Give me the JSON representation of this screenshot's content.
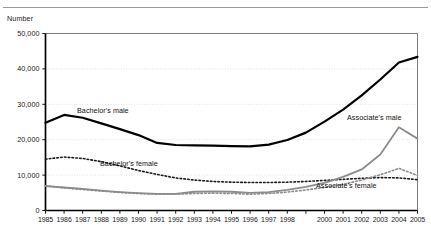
{
  "axis_label_y": "Number",
  "y_ticks": [
    "0",
    "10,000",
    "20,000",
    "30,000",
    "40,000",
    "50,000"
  ],
  "x_ticks": [
    "1985",
    "1986",
    "1987",
    "1988",
    "1989",
    "1990",
    "1991",
    "1992",
    "1993",
    "1994",
    "1995",
    "1996",
    "1997",
    "1998",
    "",
    "2000",
    "2001",
    "2002",
    "2003",
    "2004",
    "2005"
  ],
  "annotations": {
    "bachelors_male": "Bachelor's male",
    "bachelors_female": "Bachelor's female",
    "associates_male": "Associate's male",
    "associates_female": "Associate's female"
  },
  "colors": {
    "bachelors_male": "#000000",
    "bachelors_female": "#1a1a1a",
    "associates_male": "#8c8c8c",
    "associates_female": "#8c8c8c",
    "gridline": "#d9d9d9",
    "axis": "#000000",
    "rule": "#9a9a9a"
  },
  "chart_data": {
    "type": "line",
    "title": "",
    "xlabel": "",
    "ylabel": "Number",
    "ylim": [
      0,
      50000
    ],
    "ytick_values": [
      0,
      10000,
      20000,
      30000,
      40000,
      50000
    ],
    "grid": true,
    "legend": "inline-annotations",
    "x": [
      1985,
      1986,
      1987,
      1988,
      1989,
      1990,
      1991,
      1992,
      1993,
      1994,
      1995,
      1996,
      1997,
      1998,
      1999,
      2000,
      2001,
      2002,
      2003,
      2004,
      2005
    ],
    "series": [
      {
        "name": "Bachelor's male",
        "style": "solid",
        "color": "#000000",
        "width": 2.2,
        "values": [
          24800,
          27000,
          26200,
          24600,
          23000,
          21300,
          19100,
          18500,
          18400,
          18300,
          18200,
          18100,
          18600,
          19900,
          22000,
          25100,
          28500,
          32500,
          37000,
          41800,
          43400
        ]
      },
      {
        "name": "Bachelor's female",
        "style": "dotted",
        "color": "#1a1a1a",
        "width": 1.6,
        "values": [
          14500,
          15100,
          14700,
          13800,
          12600,
          11300,
          10200,
          9200,
          8600,
          8200,
          8000,
          7900,
          7900,
          8000,
          8200,
          8500,
          8800,
          9100,
          9300,
          9200,
          8700
        ]
      },
      {
        "name": "Associate's male",
        "style": "solid",
        "color": "#8c8c8c",
        "width": 1.8,
        "values": [
          6900,
          6500,
          6100,
          5600,
          5200,
          4900,
          4700,
          4700,
          5300,
          5400,
          5300,
          5000,
          5200,
          5800,
          6700,
          7800,
          9500,
          11600,
          15800,
          23500,
          20300
        ]
      },
      {
        "name": "Associate's female",
        "style": "dotted",
        "color": "#8c8c8c",
        "width": 1.6,
        "values": [
          7000,
          6400,
          5900,
          5500,
          5100,
          4800,
          4600,
          4600,
          4800,
          4900,
          4800,
          4600,
          4800,
          5200,
          5800,
          6500,
          7400,
          8600,
          10100,
          11900,
          9900
        ]
      }
    ]
  }
}
